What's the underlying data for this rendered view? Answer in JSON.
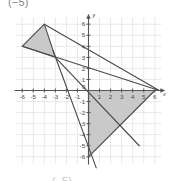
{
  "caption": {
    "top_fragment": "(−5)",
    "bottom_fragment": "(−5)"
  },
  "chart_data": {
    "type": "scatter",
    "title": "",
    "xlabel": "x",
    "ylabel": "y",
    "xlim": [
      -6.8,
      6.8
    ],
    "ylim": [
      -6.8,
      6.8
    ],
    "grid": true,
    "grid_color": "#e8e8e8",
    "axis_color": "#555555",
    "legend": "none",
    "x_ticks": [
      -6,
      -5,
      -4,
      -3,
      -2,
      -1,
      1,
      2,
      3,
      4,
      5,
      6
    ],
    "y_ticks": [
      6,
      5,
      4,
      3,
      2,
      1,
      -1,
      -2,
      -3,
      -4,
      -5,
      -6
    ],
    "x_tick_labels": [
      "-6",
      "-5",
      "-4",
      "-3",
      "-2",
      "-1",
      "1",
      "2",
      "3",
      "4",
      "5",
      "6"
    ],
    "y_tick_labels": [
      "6",
      "5",
      "4",
      "3",
      "2",
      "1",
      "-1",
      "-2",
      "-3",
      "-4",
      "-5",
      "-6"
    ],
    "origin_label": "0",
    "shapes": [
      {
        "name": "small-shaded-triangle",
        "fill": "#c9c9c9",
        "stroke": "#4a4a4a",
        "vertices": [
          [
            -4,
            6
          ],
          [
            -6,
            4
          ],
          [
            -3,
            3
          ]
        ]
      },
      {
        "name": "large-shaded-triangle",
        "fill": "#c9c9c9",
        "stroke": "#4a4a4a",
        "vertices": [
          [
            0,
            0
          ],
          [
            6,
            0
          ],
          [
            0,
            -6
          ]
        ]
      }
    ],
    "lines": [
      {
        "name": "ray-upper",
        "from": [
          -6,
          4
        ],
        "to": [
          6.4,
          0
        ],
        "stroke": "#4a4a4a"
      },
      {
        "name": "ray-middle",
        "from": [
          -4,
          6
        ],
        "to": [
          6.4,
          0
        ],
        "stroke": "#4a4a4a"
      },
      {
        "name": "ray-steep-down",
        "from": [
          -3.2,
          3.6
        ],
        "to": [
          0.7,
          -7.0
        ],
        "stroke": "#4a4a4a"
      },
      {
        "name": "ray-diagonal-down",
        "from": [
          -3,
          3
        ],
        "to": [
          4.6,
          -5.0
        ],
        "stroke": "#4a4a4a"
      }
    ]
  }
}
